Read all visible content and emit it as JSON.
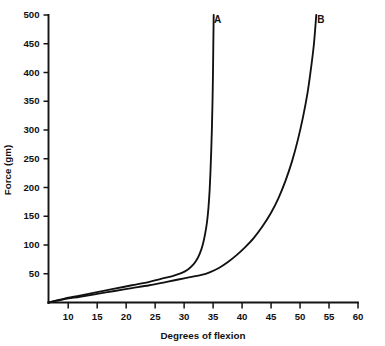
{
  "chart_data": {
    "type": "line",
    "title": "",
    "subtitle": "",
    "xlabel": "Degrees of flexion",
    "ylabel": "Force (gm)",
    "xlim": [
      6.6,
      60
    ],
    "ylim": [
      0,
      500
    ],
    "grid": false,
    "legend_position": "inline-curve-end-labels",
    "background_color": "#ffffff",
    "line_color": "#111111",
    "xticks": [
      10,
      15,
      20,
      25,
      30,
      35,
      40,
      45,
      50,
      55,
      60
    ],
    "xtick_labels": [
      "10",
      "15",
      "20",
      "25",
      "30",
      "35",
      "40",
      "45",
      "50",
      "55",
      "60"
    ],
    "yticks": [
      50,
      100,
      150,
      200,
      250,
      300,
      350,
      400,
      450,
      500
    ],
    "ytick_labels": [
      "50",
      "100",
      "150",
      "200",
      "250",
      "300",
      "350",
      "400",
      "450",
      "500"
    ],
    "series": [
      {
        "name": "A",
        "label": "A",
        "label_x": 35.8,
        "label_y": 493,
        "points": [
          [
            6.6,
            0
          ],
          [
            9,
            6
          ],
          [
            12,
            12
          ],
          [
            15,
            18
          ],
          [
            18,
            24
          ],
          [
            21,
            30
          ],
          [
            24,
            36
          ],
          [
            26,
            41
          ],
          [
            28,
            46
          ],
          [
            29.5,
            51
          ],
          [
            30.6,
            57
          ],
          [
            31.4,
            64
          ],
          [
            32.1,
            73
          ],
          [
            32.7,
            85
          ],
          [
            33.2,
            100
          ],
          [
            33.6,
            118
          ],
          [
            33.95,
            140
          ],
          [
            34.2,
            165
          ],
          [
            34.4,
            195
          ],
          [
            34.55,
            228
          ],
          [
            34.68,
            265
          ],
          [
            34.8,
            305
          ],
          [
            34.9,
            350
          ],
          [
            34.98,
            400
          ],
          [
            35.04,
            450
          ],
          [
            35.1,
            500
          ]
        ]
      },
      {
        "name": "B",
        "label": "B",
        "label_x": 53.6,
        "label_y": 493,
        "points": [
          [
            6.6,
            0
          ],
          [
            9,
            5
          ],
          [
            12,
            10
          ],
          [
            15,
            15
          ],
          [
            18,
            20
          ],
          [
            21,
            25
          ],
          [
            24,
            30
          ],
          [
            27,
            36
          ],
          [
            29,
            40
          ],
          [
            31,
            44
          ],
          [
            33,
            48
          ],
          [
            34.5,
            53
          ],
          [
            36,
            60
          ],
          [
            37.5,
            70
          ],
          [
            39,
            82
          ],
          [
            40.5,
            96
          ],
          [
            42,
            112
          ],
          [
            43.5,
            132
          ],
          [
            45,
            156
          ],
          [
            46.3,
            182
          ],
          [
            47.5,
            212
          ],
          [
            48.6,
            245
          ],
          [
            49.6,
            282
          ],
          [
            50.5,
            322
          ],
          [
            51.3,
            365
          ],
          [
            51.9,
            408
          ],
          [
            52.4,
            450
          ],
          [
            52.8,
            500
          ]
        ]
      }
    ]
  },
  "axes": {
    "x_title": "Degrees of flexion",
    "y_title": "Force (gm)"
  }
}
